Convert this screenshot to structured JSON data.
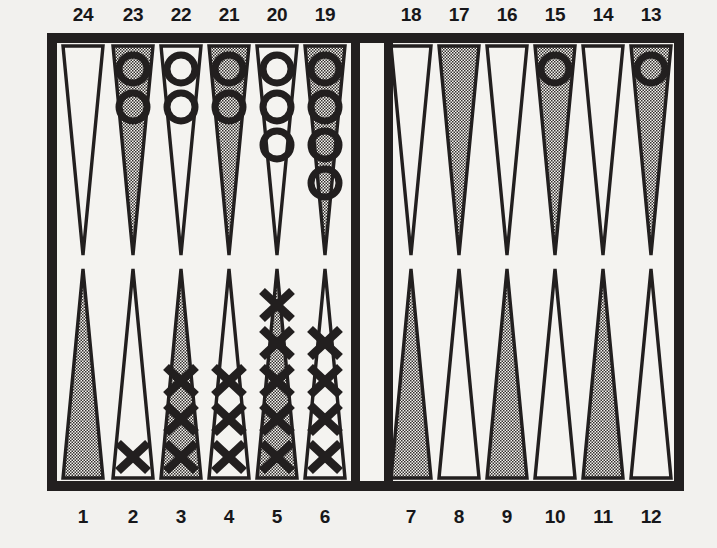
{
  "figure": {
    "name": "backgammon-board-diagram",
    "ink_color": "#221f1f",
    "board_background": "#f4f3f0",
    "shaded_point_color": "#b9b7b2",
    "page_background": "#f2f1ee"
  },
  "labels": {
    "top": [
      "24",
      "23",
      "22",
      "21",
      "20",
      "19",
      "18",
      "17",
      "16",
      "15",
      "14",
      "13"
    ],
    "bottom": [
      "1",
      "2",
      "3",
      "4",
      "5",
      "6",
      "7",
      "8",
      "9",
      "10",
      "11",
      "12"
    ]
  },
  "chart_data": {
    "type": "table",
    "xlabel": "point number",
    "ylabel": "checkers on point",
    "legend": [
      "O = open/ring checker",
      "X = cross checker"
    ],
    "categories": [
      "1",
      "2",
      "3",
      "4",
      "5",
      "6",
      "7",
      "8",
      "9",
      "10",
      "11",
      "12",
      "13",
      "14",
      "15",
      "16",
      "17",
      "18",
      "19",
      "20",
      "21",
      "22",
      "23",
      "24"
    ],
    "series": [
      {
        "name": "O",
        "values": [
          0,
          0,
          0,
          0,
          0,
          0,
          0,
          0,
          0,
          0,
          0,
          0,
          1,
          0,
          1,
          0,
          0,
          0,
          4,
          3,
          2,
          2,
          2,
          0
        ]
      },
      {
        "name": "X",
        "values": [
          0,
          1,
          3,
          3,
          5,
          4,
          0,
          0,
          0,
          0,
          0,
          0,
          0,
          0,
          0,
          0,
          0,
          0,
          0,
          0,
          0,
          0,
          0,
          0
        ]
      }
    ]
  },
  "board": {
    "points": [
      {
        "number": "24",
        "half": "top",
        "index": 0,
        "shaded": false,
        "checker_type": "none",
        "count": 0
      },
      {
        "number": "23",
        "half": "top",
        "index": 1,
        "shaded": true,
        "checker_type": "O",
        "count": 2
      },
      {
        "number": "22",
        "half": "top",
        "index": 2,
        "shaded": false,
        "checker_type": "O",
        "count": 2
      },
      {
        "number": "21",
        "half": "top",
        "index": 3,
        "shaded": true,
        "checker_type": "O",
        "count": 2
      },
      {
        "number": "20",
        "half": "top",
        "index": 4,
        "shaded": false,
        "checker_type": "O",
        "count": 3
      },
      {
        "number": "19",
        "half": "top",
        "index": 5,
        "shaded": true,
        "checker_type": "O",
        "count": 4
      },
      {
        "number": "18",
        "half": "top",
        "index": 6,
        "shaded": false,
        "checker_type": "none",
        "count": 0
      },
      {
        "number": "17",
        "half": "top",
        "index": 7,
        "shaded": true,
        "checker_type": "none",
        "count": 0
      },
      {
        "number": "16",
        "half": "top",
        "index": 8,
        "shaded": false,
        "checker_type": "none",
        "count": 0
      },
      {
        "number": "15",
        "half": "top",
        "index": 9,
        "shaded": true,
        "checker_type": "O",
        "count": 1
      },
      {
        "number": "14",
        "half": "top",
        "index": 10,
        "shaded": false,
        "checker_type": "none",
        "count": 0
      },
      {
        "number": "13",
        "half": "top",
        "index": 11,
        "shaded": true,
        "checker_type": "O",
        "count": 1
      },
      {
        "number": "1",
        "half": "bottom",
        "index": 0,
        "shaded": true,
        "checker_type": "none",
        "count": 0
      },
      {
        "number": "2",
        "half": "bottom",
        "index": 1,
        "shaded": false,
        "checker_type": "X",
        "count": 1
      },
      {
        "number": "3",
        "half": "bottom",
        "index": 2,
        "shaded": true,
        "checker_type": "X",
        "count": 3
      },
      {
        "number": "4",
        "half": "bottom",
        "index": 3,
        "shaded": false,
        "checker_type": "X",
        "count": 3
      },
      {
        "number": "5",
        "half": "bottom",
        "index": 4,
        "shaded": true,
        "checker_type": "X",
        "count": 5
      },
      {
        "number": "6",
        "half": "bottom",
        "index": 5,
        "shaded": false,
        "checker_type": "X",
        "count": 4
      },
      {
        "number": "7",
        "half": "bottom",
        "index": 6,
        "shaded": true,
        "checker_type": "none",
        "count": 0
      },
      {
        "number": "8",
        "half": "bottom",
        "index": 7,
        "shaded": false,
        "checker_type": "none",
        "count": 0
      },
      {
        "number": "9",
        "half": "bottom",
        "index": 8,
        "shaded": true,
        "checker_type": "none",
        "count": 0
      },
      {
        "number": "10",
        "half": "bottom",
        "index": 9,
        "shaded": false,
        "checker_type": "none",
        "count": 0
      },
      {
        "number": "11",
        "half": "bottom",
        "index": 10,
        "shaded": true,
        "checker_type": "none",
        "count": 0
      },
      {
        "number": "12",
        "half": "bottom",
        "index": 11,
        "shaded": false,
        "checker_type": "none",
        "count": 0
      }
    ]
  }
}
